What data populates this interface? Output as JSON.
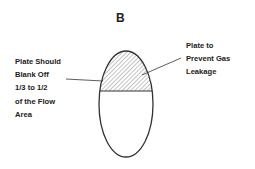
{
  "title": "B",
  "labels": {
    "left": [
      "Plate Should",
      "Blank Off",
      "1/3 to 1/2",
      "of the Flow",
      "Area"
    ],
    "right": [
      "Plate to",
      "Prevent Gas",
      "Leakage"
    ]
  },
  "colors": {
    "stroke": "#333333",
    "hatch": "#888888",
    "text": "#222222"
  }
}
